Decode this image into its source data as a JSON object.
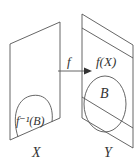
{
  "diagram": {
    "domain_label": "X",
    "codomain_label": "Y",
    "map_label": "f",
    "image_label": "f(X)",
    "set_label": "B",
    "preimage_label": "f⁻¹(B)",
    "colors": {
      "stroke": "#555555",
      "text": "#333333",
      "background": "#ffffff"
    }
  }
}
